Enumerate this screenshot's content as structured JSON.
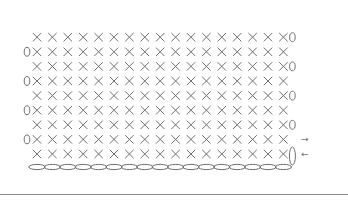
{
  "diagram": {
    "type": "crochet-chart",
    "stitch_symbol": "×",
    "stitch_meaning": "single crochet",
    "chain_symbol": "oval",
    "turning_chain_symbol": "0",
    "stitches_per_row": 17,
    "foundation_chain_count": 17,
    "rows": [
      {
        "row": 1,
        "stitches": 17,
        "turning_side": "right",
        "turning_glyph": "vertical-oval",
        "arrow": "←"
      },
      {
        "row": 2,
        "stitches": 17,
        "turning_side": "left",
        "turning_glyph": "0",
        "arrow": "→"
      },
      {
        "row": 3,
        "stitches": 17,
        "turning_side": "right",
        "turning_glyph": "0",
        "arrow": ""
      },
      {
        "row": 4,
        "stitches": 17,
        "turning_side": "left",
        "turning_glyph": "0",
        "arrow": ""
      },
      {
        "row": 5,
        "stitches": 17,
        "turning_side": "right",
        "turning_glyph": "0",
        "arrow": ""
      },
      {
        "row": 6,
        "stitches": 17,
        "turning_side": "left",
        "turning_glyph": "0",
        "arrow": ""
      },
      {
        "row": 7,
        "stitches": 17,
        "turning_side": "right",
        "turning_glyph": "0",
        "arrow": ""
      },
      {
        "row": 8,
        "stitches": 17,
        "turning_side": "left",
        "turning_glyph": "0",
        "arrow": ""
      },
      {
        "row": 9,
        "stitches": 17,
        "turning_side": "right",
        "turning_glyph": "0",
        "arrow": ""
      }
    ],
    "colors": {
      "symbol": "#6f6f6f",
      "rule": "#8c8c8c",
      "background": "#ffffff"
    }
  }
}
